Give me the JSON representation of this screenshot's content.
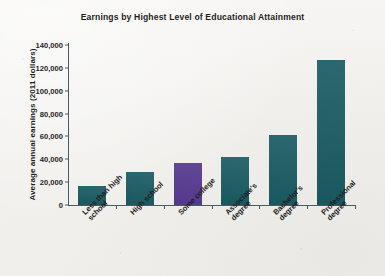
{
  "chart_data": {
    "type": "bar",
    "title": "Earnings by Highest Level of Educational Attainment",
    "xlabel": "",
    "ylabel": "Average annual earnings (2011 dollars)",
    "categories": [
      "Less than high\nschool",
      "High school",
      "Some college",
      "Associate's\ndegree",
      "Bachelor's\ndegree",
      "Professional\ndegree"
    ],
    "values": [
      17000,
      29000,
      37000,
      42000,
      61000,
      127000
    ],
    "bar_colors": [
      "#1b5c64",
      "#1b5c64",
      "#573a92",
      "#1b5c64",
      "#1b5c64",
      "#1b5c64"
    ],
    "ylim": [
      0,
      140000
    ],
    "ytick_labels": [
      "140,000",
      "120,000",
      "100,000",
      "80,000",
      "60,000",
      "40,000",
      "20,000",
      "0"
    ],
    "ytick_values": [
      140000,
      120000,
      100000,
      80000,
      60000,
      40000,
      20000,
      0
    ],
    "grid": false,
    "legend": null,
    "accent_teal": "#1b5c64",
    "accent_purple": "#573a92",
    "axis_color": "#4a5a63",
    "background": "#f4f3f1"
  }
}
